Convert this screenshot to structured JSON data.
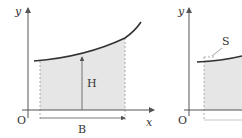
{
  "diagrams": [
    {
      "name": "left",
      "labels": {
        "y_axis": "y",
        "x_axis": "x",
        "origin": "O",
        "height": "H",
        "base": "B"
      }
    },
    {
      "name": "right",
      "labels": {
        "y_axis": "y",
        "origin": "O",
        "slice": "S"
      }
    }
  ],
  "colors": {
    "shade": "#e6e6e6",
    "curve": "#333333",
    "axis": "#555555"
  }
}
